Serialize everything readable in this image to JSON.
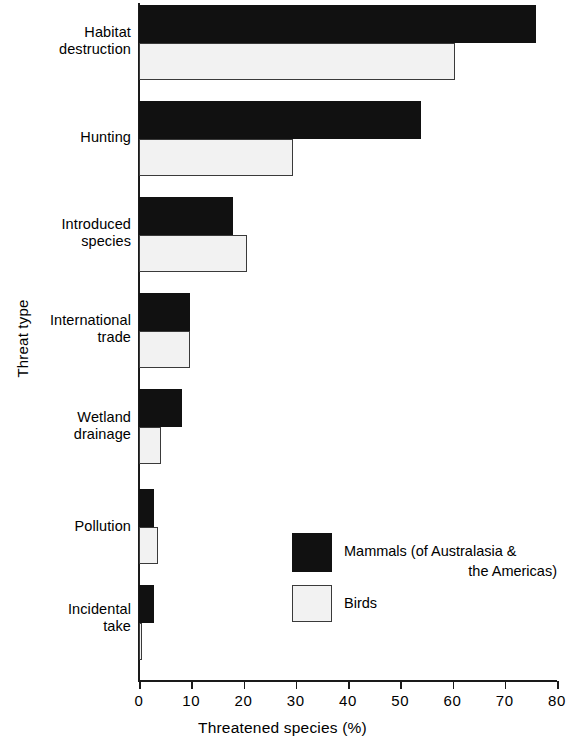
{
  "chart_data": {
    "type": "bar",
    "orientation": "horizontal",
    "title": "",
    "xlabel": "Threatened species (%)",
    "ylabel": "Threat type",
    "xlim": [
      0,
      80
    ],
    "xticks": [
      0,
      10,
      20,
      30,
      40,
      50,
      60,
      70,
      80
    ],
    "grid": false,
    "legend_position": "inside-lower-right",
    "categories": [
      "Habitat destruction",
      "Hunting",
      "Introduced species",
      "International trade",
      "Wetland drainage",
      "Pollution",
      "Incidental take"
    ],
    "series": [
      {
        "name": "Mammals (of Australasia & the Americas)",
        "color": "#111111",
        "values": [
          76,
          54,
          18,
          9.8,
          8.2,
          2.9,
          2.9
        ]
      },
      {
        "name": "Birds",
        "color": "#f2f2f2",
        "values": [
          60.5,
          29.5,
          20.7,
          9.8,
          4.2,
          3.6,
          0.5
        ]
      }
    ]
  },
  "axis": {
    "y_title": "Threat type",
    "x_title": "Threatened species (%)",
    "tick_labels": [
      "0",
      "10",
      "20",
      "30",
      "40",
      "50",
      "60",
      "70",
      "80"
    ]
  },
  "categories": [
    {
      "line1": "Habitat",
      "line2": "destruction"
    },
    {
      "line1": "Hunting",
      "line2": ""
    },
    {
      "line1": "Introduced",
      "line2": "species"
    },
    {
      "line1": "International",
      "line2": "trade"
    },
    {
      "line1": "Wetland",
      "line2": "drainage"
    },
    {
      "line1": "Pollution",
      "line2": ""
    },
    {
      "line1": "Incidental",
      "line2": "take"
    }
  ],
  "legend": {
    "items": [
      {
        "label_line1": "Mammals (of Australasia &",
        "label_line2": "the Americas)",
        "swatch": "dark"
      },
      {
        "label_line1": "Birds",
        "label_line2": "",
        "swatch": "light"
      }
    ]
  },
  "colors": {
    "series_mammals": "#111111",
    "series_birds": "#f2f2f2",
    "axis": "#1a1a1a",
    "background": "#ffffff"
  }
}
